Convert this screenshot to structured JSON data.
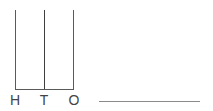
{
  "diagram": {
    "type": "place-value-abacus",
    "rods": [
      {
        "label": "H",
        "meaning": "hundreds",
        "beads": 0
      },
      {
        "label": "T",
        "meaning": "tens",
        "beads": 0
      },
      {
        "label": "O",
        "meaning": "ones",
        "beads": 0
      }
    ],
    "answer": {
      "value": "",
      "blank": true
    },
    "colors": {
      "line": "#5a5a5a",
      "label": "#444444",
      "answer_line": "#8a8a8a",
      "background": "#ffffff"
    }
  }
}
